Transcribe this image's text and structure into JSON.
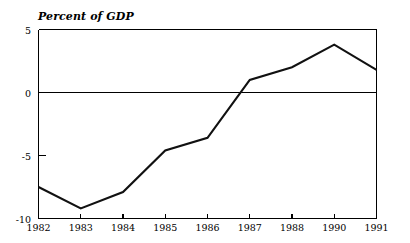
{
  "chart_data": {
    "type": "line",
    "title": "Percent of GDP",
    "xlabel": "",
    "ylabel": "",
    "categories": [
      "1982",
      "1983",
      "1984",
      "1985",
      "1986",
      "1987",
      "1988",
      "1990",
      "1991"
    ],
    "x_tick_labels": [
      "1982",
      "1983",
      "1984",
      "1985",
      "1986",
      "1987",
      "1988",
      "1990",
      "1991"
    ],
    "values": [
      -7.5,
      -9.2,
      -7.9,
      -4.6,
      -3.6,
      1.0,
      2.0,
      3.8,
      1.8
    ],
    "series": [
      {
        "name": "Percent of GDP",
        "values": [
          -7.5,
          -9.2,
          -7.9,
          -4.6,
          -3.6,
          1.0,
          2.0,
          3.8,
          1.8
        ]
      }
    ],
    "y_tick_labels": [
      "5",
      "0",
      "-5",
      "-10"
    ],
    "y_tick_values": [
      5,
      0,
      -5,
      -10
    ],
    "ylim": [
      -10,
      5
    ],
    "xlim": [
      0,
      8
    ],
    "grid": false,
    "legend": "none",
    "zero_line": 0,
    "line_color": "#111111",
    "axis_color": "#000000",
    "background_color": "#ffffff"
  }
}
